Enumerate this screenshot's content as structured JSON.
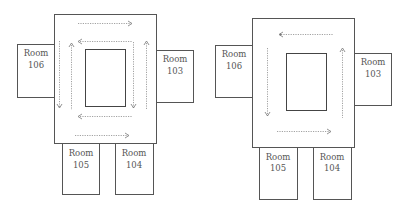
{
  "diagrams": [
    {
      "id": "left",
      "description": "Floor plan with bidirectional circulation (two loops)",
      "rooms": [
        {
          "line1": "Room",
          "line2": "106",
          "position": "left"
        },
        {
          "line1": "Room",
          "line2": "103",
          "position": "right"
        },
        {
          "line1": "Room",
          "line2": "105",
          "position": "bottom-left"
        },
        {
          "line1": "Room",
          "line2": "104",
          "position": "bottom-right"
        }
      ],
      "flow_arrows": [
        {
          "edge": "top-outer",
          "direction": "right"
        },
        {
          "edge": "top-inner",
          "direction": "left"
        },
        {
          "edge": "left-outer",
          "direction": "down"
        },
        {
          "edge": "left-inner",
          "direction": "up"
        },
        {
          "edge": "right-inner",
          "direction": "down"
        },
        {
          "edge": "right-outer",
          "direction": "up"
        },
        {
          "edge": "bottom-inner",
          "direction": "left"
        },
        {
          "edge": "bottom-outer",
          "direction": "right"
        }
      ]
    },
    {
      "id": "right",
      "description": "Floor plan with single counterclockwise circulation loop",
      "rooms": [
        {
          "line1": "Room",
          "line2": "106",
          "position": "left"
        },
        {
          "line1": "Room",
          "line2": "103",
          "position": "right"
        },
        {
          "line1": "Room",
          "line2": "105",
          "position": "bottom-left"
        },
        {
          "line1": "Room",
          "line2": "104",
          "position": "bottom-right"
        }
      ],
      "flow_arrows": [
        {
          "edge": "top",
          "direction": "left"
        },
        {
          "edge": "left",
          "direction": "down"
        },
        {
          "edge": "bottom",
          "direction": "right"
        },
        {
          "edge": "right",
          "direction": "up"
        }
      ]
    }
  ],
  "colors": {
    "walls": "#555555",
    "arrows": "#8a8a8a",
    "text": "#555555"
  }
}
